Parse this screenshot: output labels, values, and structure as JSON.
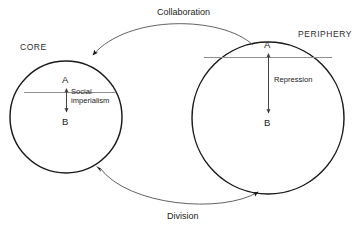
{
  "diagram": {
    "background_color": "#ffffff",
    "stroke_color": "#1a1a1a",
    "accent_line_color": "#8c8c8c",
    "regions": [
      {
        "id": "core",
        "label": "CORE",
        "nodes": [
          {
            "id": "core-a",
            "label": "A"
          },
          {
            "id": "core-b",
            "label": "B"
          }
        ],
        "internal_relation": {
          "label_line_1": "Social",
          "label_line_2": "imperialism",
          "direction": "both"
        }
      },
      {
        "id": "periphery",
        "label": "PERIPHERY",
        "nodes": [
          {
            "id": "periphery-a",
            "label": "A"
          },
          {
            "id": "periphery-b",
            "label": "B"
          }
        ],
        "internal_relation": {
          "label_line_1": "Repression",
          "label_line_2": "",
          "direction": "both"
        }
      }
    ],
    "relations": [
      {
        "id": "collaboration",
        "label": "Collaboration",
        "from": "periphery-a",
        "to": "core-a",
        "position": "top"
      },
      {
        "id": "division",
        "label": "Division",
        "from": "core-b",
        "to": "periphery-b",
        "position": "bottom"
      }
    ]
  }
}
